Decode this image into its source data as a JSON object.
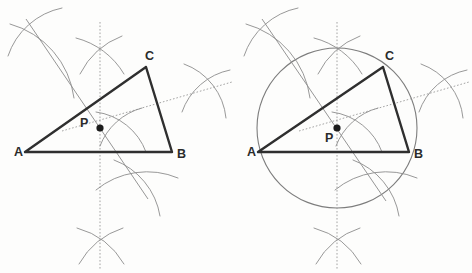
{
  "figure": {
    "background_color": "#fdfdfc",
    "width": 472,
    "height": 273,
    "stroke_colors": {
      "triangle": "#2f2f2f",
      "construction_arc": "#8c8c8c",
      "bisector": "#8a8a8a",
      "circle": "#7d7d7d",
      "label": "#2b2b2b",
      "point": "#1c1c1c"
    }
  },
  "panels": [
    {
      "id": "left-panel",
      "name": "perpendicular-bisectors-panel",
      "caption": "",
      "has_circumcircle": false,
      "labels": [
        {
          "name": "vertex-label-a",
          "text": "A",
          "x": 14,
          "y": 156
        },
        {
          "name": "vertex-label-b",
          "text": "B",
          "x": 177,
          "y": 158
        },
        {
          "name": "vertex-label-c",
          "text": "C",
          "x": 145,
          "y": 60
        },
        {
          "name": "point-label-p",
          "text": "P",
          "x": 80,
          "y": 127
        }
      ],
      "vertices": {
        "A": {
          "x": 25,
          "y": 152
        },
        "B": {
          "x": 172,
          "y": 152
        },
        "C": {
          "x": 146,
          "y": 67
        },
        "P": {
          "x": 100,
          "y": 128
        }
      },
      "arc_crosses": [
        {
          "name": "arc-cross-upper-left",
          "x": 32,
          "y": 28
        },
        {
          "name": "arc-cross-top-center",
          "x": 99,
          "y": 56
        },
        {
          "name": "arc-cross-center",
          "x": 116,
          "y": 122
        },
        {
          "name": "arc-cross-right",
          "x": 204,
          "y": 92
        },
        {
          "name": "arc-cross-lower-center",
          "x": 139,
          "y": 186
        },
        {
          "name": "arc-cross-bottom",
          "x": 100,
          "y": 246
        }
      ]
    },
    {
      "id": "right-panel",
      "name": "circumscribed-circle-panel",
      "caption": "",
      "has_circumcircle": true,
      "labels": [
        {
          "name": "vertex-label-a",
          "text": "A",
          "x": 247,
          "y": 156
        },
        {
          "name": "vertex-label-b",
          "text": "B",
          "x": 414,
          "y": 158
        },
        {
          "name": "vertex-label-c",
          "text": "C",
          "x": 385,
          "y": 60
        },
        {
          "name": "point-label-p",
          "text": "P",
          "x": 325,
          "y": 140
        }
      ],
      "vertices": {
        "A": {
          "x": 258,
          "y": 152
        },
        "B": {
          "x": 409,
          "y": 152
        },
        "C": {
          "x": 383,
          "y": 67
        },
        "P": {
          "x": 337,
          "y": 128
        }
      },
      "circumcircle": {
        "cx": 337,
        "cy": 128,
        "r": 80
      },
      "arc_crosses": [
        {
          "name": "arc-cross-upper-left",
          "x": 268,
          "y": 28
        },
        {
          "name": "arc-cross-top-center",
          "x": 338,
          "y": 56
        },
        {
          "name": "arc-cross-center",
          "x": 352,
          "y": 122
        },
        {
          "name": "arc-cross-right",
          "x": 441,
          "y": 92
        },
        {
          "name": "arc-cross-lower-center",
          "x": 378,
          "y": 186
        },
        {
          "name": "arc-cross-bottom",
          "x": 337,
          "y": 246
        }
      ]
    }
  ]
}
